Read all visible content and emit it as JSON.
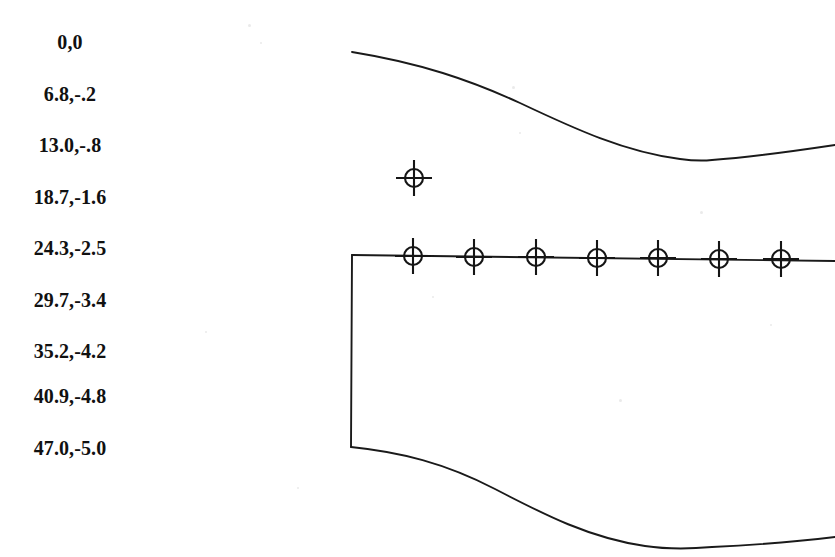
{
  "page": {
    "width": 835,
    "height": 557,
    "background_color": "#ffffff",
    "ink_color": "#1a1a1a"
  },
  "coordinate_list": {
    "name": "station-offset-table",
    "column_format": "x,y",
    "rows": [
      {
        "label": "0,0",
        "x": "0",
        "y": "0",
        "top": 31
      },
      {
        "label": "6.8,-.2",
        "x": "6.8",
        "y": "-.2",
        "top": 83
      },
      {
        "label": "13.0,-.8",
        "x": "13.0",
        "y": "-.8",
        "top": 134
      },
      {
        "label": "18.7,-1.6",
        "x": "18.7",
        "y": "-1.6",
        "top": 186
      },
      {
        "label": "24.3,-2.5",
        "x": "24.3",
        "y": "-2.5",
        "top": 237
      },
      {
        "label": "29.7,-3.4",
        "x": "29.7",
        "y": "-3.4",
        "top": 289
      },
      {
        "label": "35.2,-4.2",
        "x": "35.2",
        "y": "-4.2",
        "top": 340
      },
      {
        "label": "40.9,-4.8",
        "x": "40.9",
        "y": "-4.8",
        "top": 385
      },
      {
        "label": "47.0,-5.0",
        "x": "47.0",
        "y": "-5.0",
        "top": 437
      }
    ]
  },
  "chart_data": {
    "type": "line",
    "title": "",
    "xlabel": "",
    "ylabel": "",
    "grid": false,
    "legend": null,
    "xlim": [
      0,
      835
    ],
    "ylim": [
      557,
      0
    ],
    "series": [
      {
        "name": "upper-contour",
        "comment": "upper outer profile curve, left edge high, dips to minimum then rises",
        "path": "M 352 52 C 420 63, 470 80, 520 103 C 575 129, 625 152, 680 159 C 695 161, 702 161, 712 160 C 755 157, 795 151, 835 145"
      },
      {
        "name": "chord-baseline",
        "comment": "horizontal reference line carrying the target markers",
        "path": "M 352 255 L 835 261"
      },
      {
        "name": "left-vertical-edge",
        "comment": "vertical leading-edge line joining upper baseline to lower contour",
        "path": "M 352 255 L 351 447"
      },
      {
        "name": "lower-contour",
        "comment": "lower outer profile curve, dips to minimum then rises at right",
        "path": "M 351 447 C 400 452, 445 463, 495 489 C 545 515, 590 538, 645 546 C 665 549, 690 549, 712 547 C 755 545, 795 542, 835 537"
      }
    ],
    "markers": {
      "style": "crosshair-circle",
      "radius": 9,
      "tick_length": 9,
      "points": [
        {
          "name": "floating-target",
          "cx": 414,
          "cy": 178,
          "on_line": false
        },
        {
          "name": "baseline-target-1",
          "cx": 413,
          "cy": 256,
          "on_line": true
        },
        {
          "name": "baseline-target-2",
          "cx": 474,
          "cy": 257,
          "on_line": true
        },
        {
          "name": "baseline-target-3",
          "cx": 536,
          "cy": 257,
          "on_line": true
        },
        {
          "name": "baseline-target-4",
          "cx": 597,
          "cy": 258,
          "on_line": true
        },
        {
          "name": "baseline-target-5",
          "cx": 658,
          "cy": 258,
          "on_line": true
        },
        {
          "name": "baseline-target-6",
          "cx": 719,
          "cy": 259,
          "on_line": true
        },
        {
          "name": "baseline-target-7",
          "cx": 781,
          "cy": 259,
          "on_line": true
        }
      ]
    }
  },
  "scan_artifacts": [
    {
      "left": 248,
      "top": 24,
      "size": 3
    },
    {
      "left": 260,
      "top": 42,
      "size": 2
    },
    {
      "left": 512,
      "top": 86,
      "size": 3
    },
    {
      "left": 519,
      "top": 132,
      "size": 2
    },
    {
      "left": 700,
      "top": 211,
      "size": 3
    },
    {
      "left": 205,
      "top": 331,
      "size": 2
    },
    {
      "left": 432,
      "top": 296,
      "size": 2
    },
    {
      "left": 619,
      "top": 399,
      "size": 3
    },
    {
      "left": 297,
      "top": 487,
      "size": 2
    },
    {
      "left": 770,
      "top": 324,
      "size": 2
    }
  ]
}
